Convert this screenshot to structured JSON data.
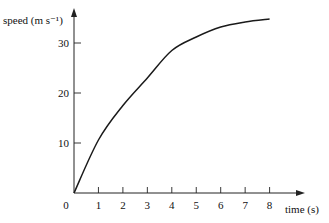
{
  "chart_data": {
    "type": "line",
    "title": "",
    "xlabel": "time (s)",
    "ylabel": "speed (m s⁻¹)",
    "xlim": [
      0,
      8
    ],
    "ylim": [
      0,
      35
    ],
    "grid": false,
    "x_ticks": [
      0,
      1,
      2,
      3,
      4,
      5,
      6,
      7,
      8
    ],
    "x_tick_labels": [
      "0",
      "1",
      "2",
      "3",
      "4",
      "5",
      "6",
      "7",
      "8"
    ],
    "y_ticks": [
      10,
      20,
      30
    ],
    "y_tick_labels": [
      "10",
      "20",
      "30"
    ],
    "series": [
      {
        "name": "speed",
        "x": [
          0,
          1,
          2,
          3,
          4,
          5,
          6,
          7,
          8
        ],
        "y": [
          0,
          10.6,
          17.5,
          23,
          28.5,
          31.2,
          33.2,
          34.2,
          34.8
        ]
      }
    ]
  }
}
